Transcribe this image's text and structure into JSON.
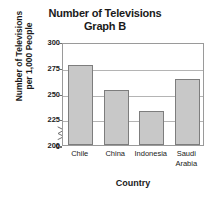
{
  "chart_data": {
    "type": "bar",
    "title": "Number of Televisions",
    "subtitle": "Graph B",
    "title_lines": [
      "Number of Televisions",
      "Graph B"
    ],
    "categories": [
      "Chile",
      "China",
      "Indonesia",
      "Saudi Arabia"
    ],
    "category_lines": [
      [
        "Chile"
      ],
      [
        "China"
      ],
      [
        "Indonesia"
      ],
      [
        "Saudi",
        "Arabia"
      ]
    ],
    "values": [
      277,
      252,
      232,
      263
    ],
    "xlabel": "Country",
    "ylabel": "Number of Televisions per 1,000 People",
    "ylabel_lines": [
      "Number of Televisions",
      "per 1,000 People"
    ],
    "ytick_labels": [
      "300",
      "275",
      "250",
      "225",
      "200",
      "0"
    ],
    "ytick_values": [
      300,
      275,
      250,
      225,
      200,
      0
    ],
    "ylim": [
      200,
      300
    ],
    "axis_break": true,
    "axis_break_between": [
      0,
      200
    ],
    "grid": true,
    "grid_axis": "y",
    "legend": false,
    "bar_fill_color": "#c8c8c8",
    "bar_border_color": "#7d7d7d",
    "gridline_color": "#b4b4b4",
    "plot_border_color": "#9a9a9a",
    "text_color": "#1a1a1a",
    "background_color": "#ffffff"
  }
}
